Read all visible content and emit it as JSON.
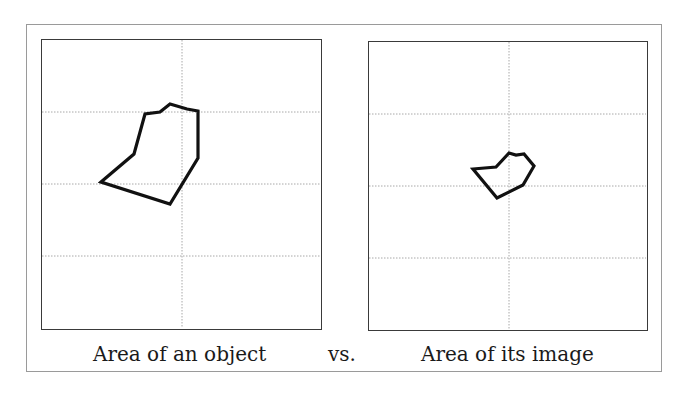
{
  "figure": {
    "left_caption": "Area of an object",
    "middle_caption": "vs.",
    "right_caption": "Area of its image",
    "stroke_color": "#111111",
    "grid_color": "#a8a8a8",
    "border_color": "#3a3a3a",
    "frame_color": "#9a9a9a"
  },
  "panels": [
    {
      "name": "object",
      "grid": {
        "vertical_lines": 1,
        "horizontal_lines": 3
      },
      "polygon_points": "59,142 92,114 103,74 118,72 128,64 145,69 156,71 156,118 128,164"
    },
    {
      "name": "image",
      "grid": {
        "vertical_lines": 1,
        "horizontal_lines": 3
      },
      "polygon_points": "104,127 127,125 140,111 147,113 155,112 165,124 154,143 128,156"
    }
  ]
}
